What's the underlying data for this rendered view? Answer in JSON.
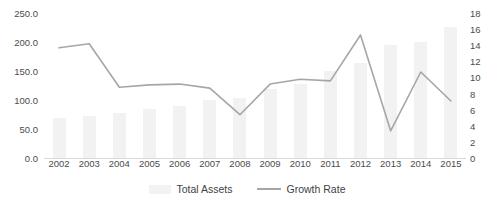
{
  "chart_data": {
    "type": "bar",
    "title": "",
    "subtitle": "",
    "xlabel": "",
    "ylabel": "",
    "categories": [
      "2002",
      "2003",
      "2004",
      "2005",
      "2006",
      "2007",
      "2008",
      "2009",
      "2010",
      "2011",
      "2012",
      "2013",
      "2014",
      "2015"
    ],
    "series": [
      {
        "name": "Total Assets",
        "type": "bar",
        "axis": "left",
        "color": "#f2f2f2",
        "values": [
          71,
          75,
          80,
          86,
          91,
          102,
          106,
          120,
          129,
          151,
          166,
          197,
          201,
          228
        ]
      },
      {
        "name": "Growth Rate",
        "type": "line",
        "axis": "right",
        "color": "#a6a6a6",
        "values": [
          13.8,
          14.3,
          8.9,
          9.2,
          9.3,
          8.8,
          5.5,
          9.3,
          9.9,
          9.7,
          15.4,
          3.5,
          10.8,
          7.2
        ]
      }
    ],
    "axes": {
      "left": {
        "min": 0,
        "max": 250,
        "step": 50,
        "ticks": [
          "0.0",
          "50.0",
          "100.0",
          "150.0",
          "200.0",
          "250.0"
        ]
      },
      "right": {
        "min": 0,
        "max": 18,
        "step": 2,
        "ticks": [
          "0",
          "2",
          "4",
          "6",
          "8",
          "10",
          "12",
          "14",
          "16",
          "18"
        ]
      }
    },
    "grid": false,
    "legend": {
      "position": "bottom",
      "entries": [
        {
          "label": "Total Assets",
          "marker": "bar-swatch",
          "color": "#f2f2f2"
        },
        {
          "label": "Growth Rate",
          "marker": "line-swatch",
          "color": "#a6a6a6"
        }
      ]
    }
  }
}
